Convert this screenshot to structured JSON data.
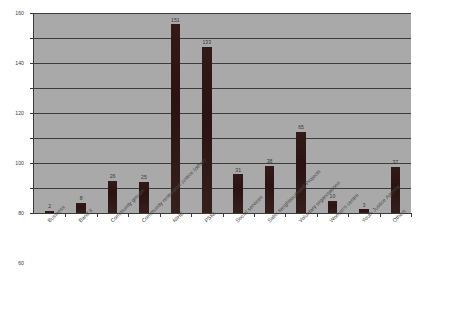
{
  "chart_data": {
    "type": "bar",
    "title": "",
    "subtitle": "",
    "xlabel": "",
    "ylabel": "",
    "ylim": [
      0,
      160
    ],
    "ytick_step": 20,
    "yticks": [
      0,
      20,
      40,
      60,
      80,
      100,
      120,
      140,
      160
    ],
    "grid": true,
    "grid_axis": "y",
    "legend": false,
    "legend_position": "none",
    "bar_color": "#2b1514",
    "plot_background": "#a9a9a9",
    "axis_color": "#3a3a3a",
    "data_labels": true,
    "categories": [
      "Business",
      "Band II",
      "Community groups",
      "Community restorative justice (other)",
      "NIHE",
      "PSNI",
      "Social services",
      "Safer Neighbourhood Projects",
      "Voluntary organisations",
      "Women's centre",
      "Youth Justice Agency",
      "Others"
    ],
    "values": [
      2,
      8,
      26,
      25,
      151,
      133,
      31,
      38,
      65,
      10,
      3,
      37
    ],
    "series": [
      {
        "name": "Count",
        "values": [
          2,
          8,
          26,
          25,
          151,
          133,
          31,
          38,
          65,
          10,
          3,
          37
        ]
      }
    ]
  }
}
